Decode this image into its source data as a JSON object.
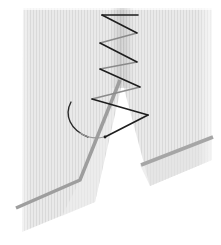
{
  "illustration": {
    "subject": "zigzag stitch over a slit in fabric",
    "colors": {
      "background": "#ffffff",
      "fabric": "#e6e6e6",
      "fabric_stripe": "#d8d8d8",
      "fabric_shadow": "#cfcfcf",
      "seam_fold": "#a0a0a0",
      "thread_front": "#1e1e1e",
      "thread_back": "#8a8a8a"
    }
  }
}
